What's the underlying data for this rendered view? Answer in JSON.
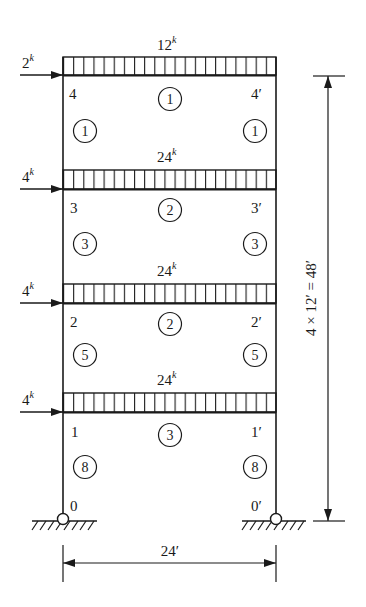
{
  "diagram": {
    "type": "structural-frame",
    "stories": 4,
    "bays": 1,
    "colors": {
      "ink": "#1a1a1a",
      "background": "#ffffff"
    },
    "floors": [
      {
        "level": 4,
        "distributed_load": "12",
        "distributed_load_unit": "k",
        "lateral_load": "2",
        "lateral_load_unit": "k",
        "left_joint": "4",
        "right_joint": "4′",
        "beam_member": "1",
        "columns_below": {
          "left": "1",
          "right": "1"
        }
      },
      {
        "level": 3,
        "distributed_load": "24",
        "distributed_load_unit": "k",
        "lateral_load": "4",
        "lateral_load_unit": "k",
        "left_joint": "3",
        "right_joint": "3′",
        "beam_member": "2",
        "columns_below": {
          "left": "3",
          "right": "3"
        }
      },
      {
        "level": 2,
        "distributed_load": "24",
        "distributed_load_unit": "k",
        "lateral_load": "4",
        "lateral_load_unit": "k",
        "left_joint": "2",
        "right_joint": "2′",
        "beam_member": "2",
        "columns_below": {
          "left": "5",
          "right": "5"
        }
      },
      {
        "level": 1,
        "distributed_load": "24",
        "distributed_load_unit": "k",
        "lateral_load": "4",
        "lateral_load_unit": "k",
        "left_joint": "1",
        "right_joint": "1′",
        "beam_member": "3",
        "columns_below": {
          "left": "8",
          "right": "8"
        }
      }
    ],
    "supports": {
      "left_joint": "0",
      "right_joint": "0′",
      "type": "pin"
    },
    "dimensions": {
      "width_label": "24′",
      "height_label": "4 × 12′ = 48′"
    }
  }
}
